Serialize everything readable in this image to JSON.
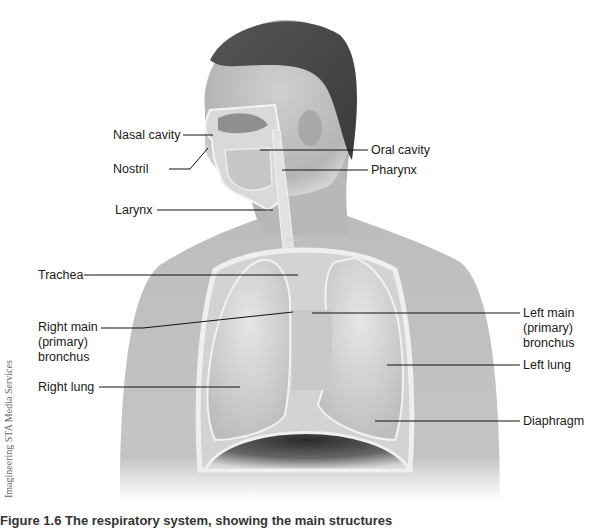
{
  "figure": {
    "credit": "Imagineering STA Media Services",
    "caption": "Figure 1.6  The respiratory system, showing the main structures",
    "labels": {
      "nasal_cavity": "Nasal cavity",
      "nostril": "Nostril",
      "oral_cavity": "Oral cavity",
      "pharynx": "Pharynx",
      "larynx": "Larynx",
      "trachea": "Trachea",
      "right_main_bronchus": "Right main\n(primary)\nbronchus",
      "left_main_bronchus": "Left main\n(primary)\nbronchus",
      "right_lung": "Right lung",
      "left_lung": "Left lung",
      "diaphragm": "Diaphragm"
    }
  }
}
